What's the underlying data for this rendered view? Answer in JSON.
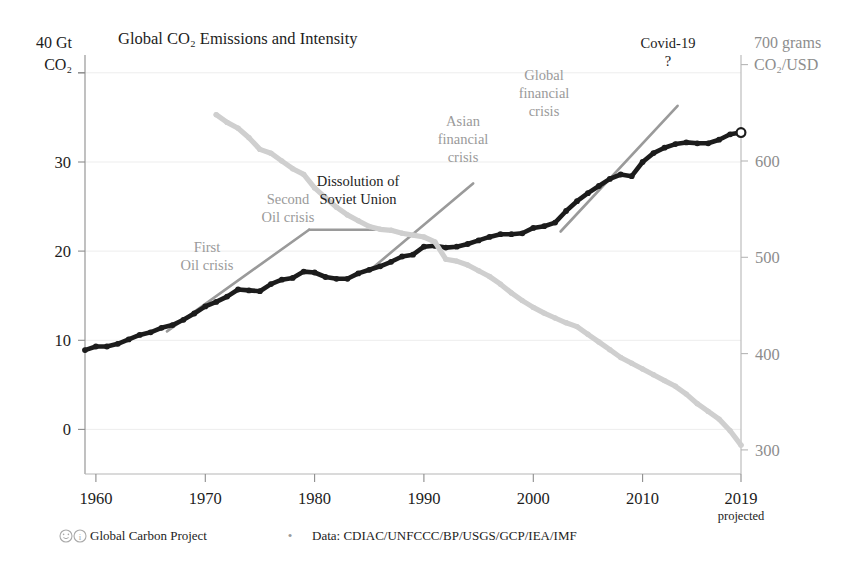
{
  "chart_data": {
    "type": "line",
    "title_display": "Global CO₂ Emissions and Intensity",
    "xlabel": "",
    "x_tick_labels": [
      "1960",
      "1970",
      "1980",
      "1990",
      "2000",
      "2010",
      "2019"
    ],
    "x_tick_values": [
      1960,
      1970,
      1980,
      1990,
      2000,
      2010,
      2019
    ],
    "x_last_tick_sublabel": "projected",
    "xlim": [
      1959,
      2019
    ],
    "grid": true,
    "legend_position": "none",
    "axes": [
      {
        "id": "left",
        "label": "40 Gt CO2",
        "label_line1": "40 Gt",
        "label_line2": "CO₂",
        "unit": "Gt CO₂",
        "ticks": [
          0,
          10,
          20,
          30,
          40
        ],
        "tick_labels": [
          "0",
          "10",
          "20",
          "30",
          "40"
        ],
        "ylim": [
          -5,
          42
        ],
        "color": "#1c1c1c"
      },
      {
        "id": "right",
        "label": "700 grams CO2/USD",
        "label_line1": "700 grams",
        "label_line2": "CO₂/USD",
        "unit": "grams CO₂/USD",
        "ticks": [
          300,
          400,
          500,
          600,
          700
        ],
        "tick_labels": [
          "300",
          "400",
          "500",
          "600",
          "700"
        ],
        "ylim": [
          275,
          710
        ],
        "color": "#8d8d8d"
      }
    ],
    "series": [
      {
        "name": "Global CO2 emissions",
        "axis": "left",
        "color": "#1c1c1c",
        "unit": "Gt CO2",
        "marker": "dot",
        "x": [
          1959,
          1960,
          1961,
          1962,
          1963,
          1964,
          1965,
          1966,
          1967,
          1968,
          1969,
          1970,
          1971,
          1972,
          1973,
          1974,
          1975,
          1976,
          1977,
          1978,
          1979,
          1980,
          1981,
          1982,
          1983,
          1984,
          1985,
          1986,
          1987,
          1988,
          1989,
          1990,
          1991,
          1992,
          1993,
          1994,
          1995,
          1996,
          1997,
          1998,
          1999,
          2000,
          2001,
          2002,
          2003,
          2004,
          2005,
          2006,
          2007,
          2008,
          2009,
          2010,
          2011,
          2012,
          2013,
          2014,
          2015,
          2016,
          2017,
          2018,
          2019
        ],
        "values": [
          8.9,
          9.3,
          9.3,
          9.6,
          10.1,
          10.6,
          10.9,
          11.4,
          11.7,
          12.3,
          13.0,
          13.8,
          14.3,
          14.9,
          15.7,
          15.6,
          15.5,
          16.3,
          16.8,
          17.0,
          17.7,
          17.6,
          17.1,
          16.9,
          16.9,
          17.5,
          17.9,
          18.3,
          18.8,
          19.4,
          19.6,
          20.5,
          20.6,
          20.4,
          20.5,
          20.8,
          21.2,
          21.6,
          21.9,
          21.9,
          22.0,
          22.6,
          22.8,
          23.2,
          24.5,
          25.6,
          26.5,
          27.3,
          28.1,
          28.6,
          28.4,
          30.0,
          31.0,
          31.6,
          32.0,
          32.2,
          32.1,
          32.1,
          32.5,
          33.1,
          33.3
        ],
        "last_point_open_marker": true
      },
      {
        "name": "CO2 intensity of the economy",
        "axis": "right",
        "color": "#cfcfcf",
        "unit": "grams CO2 per USD",
        "marker": "dot",
        "x": [
          1971,
          1972,
          1973,
          1974,
          1975,
          1976,
          1977,
          1978,
          1979,
          1980,
          1981,
          1982,
          1983,
          1984,
          1985,
          1986,
          1987,
          1988,
          1989,
          1990,
          1991,
          1992,
          1993,
          1994,
          1995,
          1996,
          1997,
          1998,
          1999,
          2000,
          2001,
          2002,
          2003,
          2004,
          2005,
          2006,
          2007,
          2008,
          2009,
          2010,
          2011,
          2012,
          2013,
          2014,
          2015,
          2016,
          2017,
          2018,
          2019
        ],
        "values": [
          648,
          640,
          634,
          624,
          612,
          608,
          600,
          592,
          586,
          572,
          562,
          552,
          544,
          538,
          532,
          529,
          528,
          525,
          523,
          521,
          516,
          498,
          496,
          492,
          486,
          480,
          472,
          463,
          455,
          448,
          442,
          437,
          432,
          428,
          420,
          412,
          404,
          396,
          390,
          384,
          378,
          372,
          366,
          358,
          348,
          340,
          332,
          320,
          305
        ]
      }
    ],
    "trend_lines": [
      {
        "name": "trend-1966-1979",
        "axis": "left",
        "color": "#9a9a9a",
        "x": [
          1966.5,
          1979.5
        ],
        "y": [
          11.0,
          22.4
        ]
      },
      {
        "name": "trend-1979-1985-plateau",
        "axis": "left",
        "color": "#9a9a9a",
        "x": [
          1979.5,
          1985.5
        ],
        "y": [
          22.4,
          22.4
        ]
      },
      {
        "name": "trend-1985-1994",
        "axis": "left",
        "color": "#9a9a9a",
        "x": [
          1985.0,
          1994.5
        ],
        "y": [
          17.8,
          27.6
        ]
      },
      {
        "name": "trend-2002-2013",
        "axis": "left",
        "color": "#9a9a9a",
        "x": [
          2002.5,
          2013.2
        ],
        "y": [
          22.2,
          36.3
        ]
      }
    ],
    "annotations": [
      {
        "id": "first-oil-crisis",
        "lines": [
          "First",
          "Oil crisis"
        ],
        "color": "#9a9a9a",
        "x_px": 207,
        "y_px": 252
      },
      {
        "id": "second-oil-crisis",
        "lines": [
          "Second",
          "Oil crisis"
        ],
        "color": "#9a9a9a",
        "x_px": 288,
        "y_px": 204
      },
      {
        "id": "dissolution-of-soviet-union",
        "lines": [
          "Dissolution of",
          "Soviet Union"
        ],
        "color": "#1c1c1c",
        "x_px": 358,
        "y_px": 186
      },
      {
        "id": "asian-financial-crisis",
        "lines": [
          "Asian",
          "financial",
          "crisis"
        ],
        "color": "#9a9a9a",
        "x_px": 463,
        "y_px": 126
      },
      {
        "id": "global-financial-crisis",
        "lines": [
          "Global",
          "financial",
          "crisis"
        ],
        "color": "#9a9a9a",
        "x_px": 544,
        "y_px": 80
      },
      {
        "id": "covid-19",
        "lines": [
          "Covid-19",
          "?"
        ],
        "color": "#1c1c1c",
        "x_px": 668,
        "y_px": 48
      }
    ]
  },
  "footer": {
    "license_icons": "☺①",
    "org": "Global Carbon Project",
    "separator": "•",
    "source": "Data: CDIAC/UNFCCC/BP/USGS/GCP/IEA/IMF"
  },
  "colors": {
    "emissions": "#1c1c1c",
    "intensity": "#cfcfcf",
    "trend": "#9a9a9a",
    "axis": "#9a9a9a",
    "grid": "#ededed",
    "background": "#ffffff"
  }
}
